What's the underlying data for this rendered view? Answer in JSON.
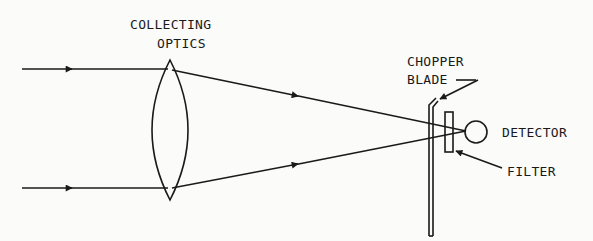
{
  "diagram": {
    "title_lines": [
      "COLLECTING",
      "OPTICS"
    ],
    "labels": {
      "collecting": "COLLECTING",
      "optics": "OPTICS",
      "chopper": "CHOPPER",
      "blade": "BLADE",
      "detector": "DETECTOR",
      "filter": "FILTER"
    },
    "components": [
      "incoming-rays",
      "collecting-lens",
      "chopper-blade",
      "filter",
      "detector"
    ],
    "colors": {
      "ink": "#1a1a1a",
      "background": "#fbfbfa"
    }
  }
}
